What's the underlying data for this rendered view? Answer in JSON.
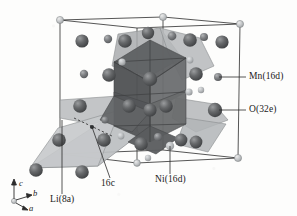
{
  "figure": {
    "type": "crystal-structure-diagram",
    "background_color": "#fdfdfc",
    "line_color": "#2b2b2b"
  },
  "labels": {
    "mn": "Mn(16d)",
    "o": "O(32e)",
    "ni": "Ni(16d)",
    "site_16c": "16c",
    "li": "Li(8a)"
  },
  "axes": {
    "c": "c",
    "b": "b",
    "a": "a",
    "origin_x": 14,
    "origin_y": 201
  },
  "colors": {
    "oxygen_sphere": "#5d5f61",
    "oxygen_sphere_dark": "#4a4c4e",
    "metal_sphere_mid": "#7a7c7e",
    "vertex_sphere": "#b9bcbe",
    "octahedron_dark": "#5a5c5e",
    "octahedron_mid": "#74767a",
    "tetrahedron_light": "#bcbfc1",
    "polyhedron_pale": "#a9acae",
    "outline": "#2b2b2b",
    "leader_line": "#2b2b2b"
  },
  "cell": {
    "vertices": {
      "top_left": [
        60,
        20
      ],
      "top_back": [
        163,
        17
      ],
      "top_right": [
        240,
        24
      ],
      "top_front": [
        137,
        28
      ],
      "bottom_left": [
        60,
        154
      ],
      "bottom_back": [
        163,
        150
      ],
      "bottom_right": [
        238,
        158
      ],
      "bottom_front": [
        137,
        163
      ]
    }
  },
  "leaders": {
    "mn": {
      "text_x": 249,
      "text_y": 72,
      "tip_x": 219,
      "tip_y": 77
    },
    "o": {
      "text_x": 249,
      "text_y": 106,
      "tip_x": 219,
      "tip_y": 110
    },
    "ni": {
      "text_x": 158,
      "text_y": 180,
      "tip_x": 170,
      "tip_y": 146
    },
    "site_16c": {
      "text_x": 101,
      "text_y": 184,
      "tip_x": 92,
      "tip_y": 132
    },
    "li": {
      "text_x": 52,
      "text_y": 200,
      "tip_x": 62,
      "tip_y": 163
    }
  },
  "atom_groups": {
    "oxygen_large": "O(32e) large dark spheres",
    "transition_metal": "Mn/Ni(16d) medium spheres inside octahedra",
    "lithium": "Li(8a) spheres in tetrahedral sites",
    "cell_corner": "unit-cell corner markers"
  }
}
